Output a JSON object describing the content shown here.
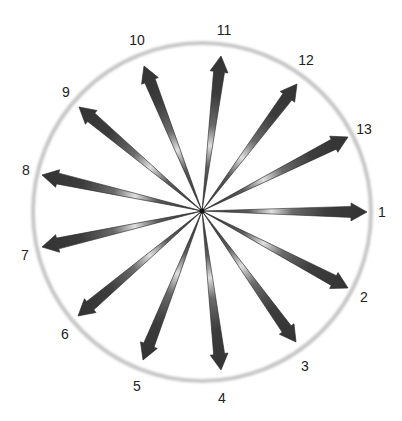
{
  "diagram": {
    "type": "radial-arrows",
    "center": {
      "x": 202,
      "y": 211
    },
    "circle": {
      "radius": 169,
      "stroke_color": "#c8c8c8",
      "stroke_width": 4
    },
    "arrow_count": 13,
    "arrow_color_dark": "#3a3a3a",
    "arrow_color_highlight": "#d8d8d8",
    "arrows": [
      {
        "label": "1",
        "tip": {
          "x": 367,
          "y": 212
        },
        "label_pos": {
          "x": 382,
          "y": 217
        }
      },
      {
        "label": "2",
        "tip": {
          "x": 348,
          "y": 288
        },
        "label_pos": {
          "x": 364,
          "y": 302
        }
      },
      {
        "label": "3",
        "tip": {
          "x": 296,
          "y": 342
        },
        "label_pos": {
          "x": 305,
          "y": 371
        }
      },
      {
        "label": "4",
        "tip": {
          "x": 221,
          "y": 370
        },
        "label_pos": {
          "x": 222,
          "y": 403
        }
      },
      {
        "label": "5",
        "tip": {
          "x": 143,
          "y": 360
        },
        "label_pos": {
          "x": 137,
          "y": 391
        }
      },
      {
        "label": "6",
        "tip": {
          "x": 78,
          "y": 316
        },
        "label_pos": {
          "x": 65,
          "y": 339
        }
      },
      {
        "label": "7",
        "tip": {
          "x": 42,
          "y": 247
        },
        "label_pos": {
          "x": 25,
          "y": 260
        }
      },
      {
        "label": "8",
        "tip": {
          "x": 42,
          "y": 175
        },
        "label_pos": {
          "x": 26,
          "y": 175
        }
      },
      {
        "label": "9",
        "tip": {
          "x": 79,
          "y": 107
        },
        "label_pos": {
          "x": 66,
          "y": 97
        }
      },
      {
        "label": "10",
        "tip": {
          "x": 144,
          "y": 66
        },
        "label_pos": {
          "x": 137,
          "y": 45
        }
      },
      {
        "label": "11",
        "tip": {
          "x": 221,
          "y": 56
        },
        "label_pos": {
          "x": 224,
          "y": 35
        }
      },
      {
        "label": "12",
        "tip": {
          "x": 297,
          "y": 84
        },
        "label_pos": {
          "x": 306,
          "y": 65
        }
      },
      {
        "label": "13",
        "tip": {
          "x": 348,
          "y": 137
        },
        "label_pos": {
          "x": 364,
          "y": 134
        }
      }
    ]
  }
}
